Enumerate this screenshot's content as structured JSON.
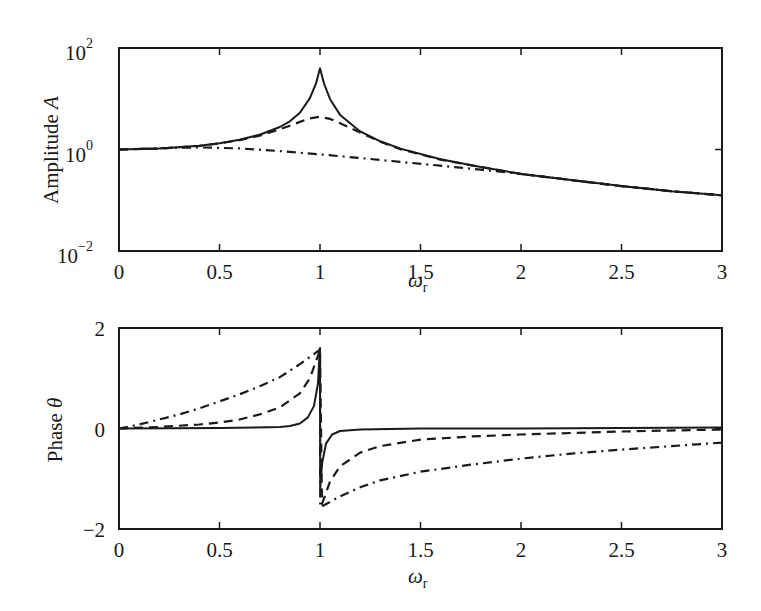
{
  "chart_data": [
    {
      "type": "line",
      "title": "",
      "xlabel": "ω_r",
      "ylabel": "Amplitude A",
      "yscale": "log",
      "xlim": [
        0,
        3
      ],
      "ylim": [
        0.01,
        100
      ],
      "grid": false,
      "legend": null,
      "x_ticks": [
        "0",
        "0.5",
        "1",
        "1.5",
        "2",
        "2.5",
        "3"
      ],
      "y_ticks": [
        {
          "base": "10",
          "exp": "2"
        },
        {
          "base": "10",
          "exp": "0"
        },
        {
          "base": "10",
          "exp": "−2"
        }
      ],
      "series": [
        {
          "name": "solid (light damping)",
          "style": "solid",
          "x": [
            0,
            0.2,
            0.4,
            0.5,
            0.6,
            0.7,
            0.8,
            0.85,
            0.9,
            0.95,
            0.98,
            1.0,
            1.02,
            1.05,
            1.1,
            1.2,
            1.3,
            1.4,
            1.6,
            1.8,
            2.0,
            2.25,
            2.5,
            2.75,
            3.0
          ],
          "values": [
            1.0,
            1.04,
            1.19,
            1.33,
            1.56,
            1.96,
            2.78,
            3.6,
            5.3,
            10.3,
            20,
            40,
            20,
            9.8,
            4.8,
            2.27,
            1.45,
            1.04,
            0.64,
            0.45,
            0.33,
            0.25,
            0.19,
            0.15,
            0.125
          ]
        },
        {
          "name": "dashed (moderate damping)",
          "style": "dashed",
          "x": [
            0,
            0.2,
            0.4,
            0.5,
            0.6,
            0.7,
            0.8,
            0.85,
            0.9,
            0.95,
            1.0,
            1.05,
            1.1,
            1.2,
            1.3,
            1.4,
            1.6,
            1.8,
            2.0,
            2.25,
            2.5,
            2.75,
            3.0
          ],
          "values": [
            1.0,
            1.04,
            1.18,
            1.32,
            1.53,
            1.88,
            2.5,
            2.95,
            3.5,
            4.1,
            4.4,
            4.0,
            3.3,
            2.15,
            1.42,
            1.02,
            0.63,
            0.45,
            0.33,
            0.25,
            0.19,
            0.15,
            0.125
          ]
        },
        {
          "name": "dash-dot (heavy damping)",
          "style": "dash-dot",
          "x": [
            0,
            0.2,
            0.4,
            0.6,
            0.8,
            1.0,
            1.2,
            1.4,
            1.6,
            1.8,
            2.0,
            2.25,
            2.5,
            2.75,
            3.0
          ],
          "values": [
            1.0,
            1.06,
            1.1,
            1.05,
            0.93,
            0.8,
            0.68,
            0.57,
            0.48,
            0.4,
            0.33,
            0.25,
            0.19,
            0.15,
            0.125
          ]
        }
      ]
    },
    {
      "type": "line",
      "title": "",
      "xlabel": "ω_r",
      "ylabel": "Phase θ",
      "yscale": "linear",
      "xlim": [
        0,
        3
      ],
      "ylim": [
        -2,
        2
      ],
      "grid": false,
      "legend": null,
      "x_ticks": [
        "0",
        "0.5",
        "1",
        "1.5",
        "2",
        "2.5",
        "3"
      ],
      "y_ticks": [
        "2",
        "0",
        "−2"
      ],
      "series": [
        {
          "name": "solid (light damping)",
          "style": "solid",
          "x": [
            0,
            0.5,
            0.8,
            0.85,
            0.9,
            0.94,
            0.97,
            0.99,
            0.999,
            1.0,
            1.001,
            1.01,
            1.03,
            1.06,
            1.1,
            1.2,
            1.5,
            2.0,
            2.5,
            3.0
          ],
          "values": [
            0,
            0.01,
            0.03,
            0.05,
            0.1,
            0.22,
            0.45,
            0.9,
            1.57,
            1.6,
            -1.2,
            -0.7,
            -0.3,
            -0.12,
            -0.05,
            -0.02,
            0.0,
            0.0,
            0.01,
            0.02
          ]
        },
        {
          "name": "dashed (moderate damping)",
          "style": "dashed",
          "x": [
            0,
            0.2,
            0.4,
            0.5,
            0.6,
            0.7,
            0.8,
            0.9,
            0.95,
            0.99,
            1.0,
            1.01,
            1.05,
            1.1,
            1.2,
            1.3,
            1.5,
            1.75,
            2.0,
            2.5,
            3.0
          ],
          "values": [
            0,
            0.03,
            0.08,
            0.12,
            0.18,
            0.28,
            0.42,
            0.7,
            1.0,
            1.45,
            1.57,
            -1.5,
            -1.05,
            -0.75,
            -0.48,
            -0.35,
            -0.22,
            -0.16,
            -0.12,
            -0.06,
            -0.02
          ]
        },
        {
          "name": "dash-dot (heavy damping)",
          "style": "dash-dot",
          "x": [
            0,
            0.1,
            0.2,
            0.3,
            0.4,
            0.5,
            0.6,
            0.7,
            0.8,
            0.9,
            1.0,
            1.001,
            1.1,
            1.2,
            1.3,
            1.5,
            1.75,
            2.0,
            2.25,
            2.5,
            2.75,
            3.0
          ],
          "values": [
            0,
            0.08,
            0.18,
            0.28,
            0.4,
            0.54,
            0.68,
            0.84,
            1.02,
            1.28,
            1.57,
            -1.57,
            -1.35,
            -1.17,
            -1.03,
            -0.86,
            -0.72,
            -0.6,
            -0.5,
            -0.42,
            -0.35,
            -0.28
          ]
        }
      ]
    }
  ],
  "labels": {
    "top_ylabel": "Amplitude ",
    "top_ylabel_var": "A",
    "bottom_ylabel": "Phase ",
    "bottom_ylabel_var": "θ",
    "xlabel_main": "ω",
    "xlabel_sub": "r"
  }
}
